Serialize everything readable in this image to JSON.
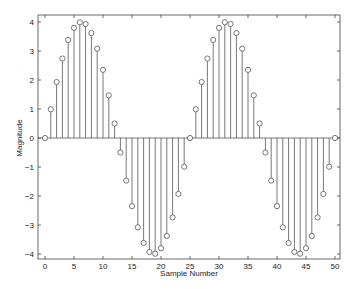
{
  "chart_data": {
    "type": "stem",
    "title": "",
    "xlabel": "Sample Number",
    "ylabel": "Magnitude",
    "xlim": [
      -1,
      51
    ],
    "ylim": [
      -4.2,
      4.2
    ],
    "xticks": [
      0,
      5,
      10,
      15,
      20,
      25,
      30,
      35,
      40,
      45,
      50
    ],
    "yticks": [
      -4,
      -3,
      -2,
      -1,
      0,
      1,
      2,
      3,
      4
    ],
    "grid": false,
    "legend": null,
    "series": [
      {
        "name": "x[n] = 4 sin(2πn/25)",
        "x": [
          0,
          1,
          2,
          3,
          4,
          5,
          6,
          7,
          8,
          9,
          10,
          11,
          12,
          13,
          14,
          15,
          16,
          17,
          18,
          19,
          20,
          21,
          22,
          23,
          24,
          25,
          26,
          27,
          28,
          29,
          30,
          31,
          32,
          33,
          34,
          35,
          36,
          37,
          38,
          39,
          40,
          41,
          42,
          43,
          44,
          45,
          46,
          47,
          48,
          49,
          50
        ],
        "values": [
          0,
          0.99,
          1.93,
          2.74,
          3.38,
          3.8,
          3.99,
          3.93,
          3.62,
          3.08,
          2.35,
          1.47,
          0.5,
          -0.5,
          -1.47,
          -2.35,
          -3.08,
          -3.62,
          -3.93,
          -3.99,
          -3.8,
          -3.38,
          -2.74,
          -1.93,
          -0.99,
          0,
          0.99,
          1.93,
          2.74,
          3.38,
          3.8,
          3.99,
          3.93,
          3.62,
          3.08,
          2.35,
          1.47,
          0.5,
          -0.5,
          -1.47,
          -2.35,
          -3.08,
          -3.62,
          -3.93,
          -3.99,
          -3.8,
          -3.38,
          -2.74,
          -1.93,
          -0.99,
          0
        ]
      }
    ],
    "colors": {
      "stem": "#555555",
      "marker": "#555555",
      "axes": "#444444",
      "background": "#ffffff"
    }
  }
}
